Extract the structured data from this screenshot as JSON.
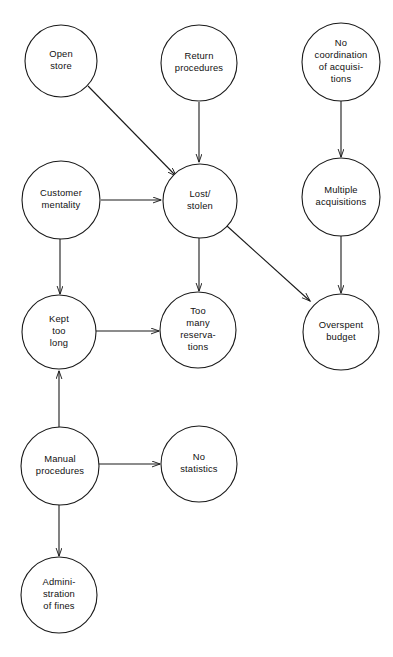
{
  "diagram": {
    "type": "causal-relationship-diagram",
    "title": "",
    "canvas": {
      "width": 393,
      "height": 657,
      "background": "#ffffff"
    },
    "style": {
      "stroke": "#1a1a1a",
      "node_fill": "#ffffff",
      "text_color": "#111111"
    },
    "nodes": [
      {
        "id": "open-store",
        "label": "Open store",
        "lines": [
          "Open",
          "store"
        ],
        "cx": 61,
        "cy": 61,
        "r": 36
      },
      {
        "id": "return-procedures",
        "label": "Return procedures",
        "lines": [
          "Return",
          "procedures"
        ],
        "cx": 199,
        "cy": 63,
        "r": 38
      },
      {
        "id": "no-coordination-of-acquisitions",
        "label": "No coordination of acquisitions",
        "lines": [
          "No",
          "coordination",
          "of acquisi-",
          "tions"
        ],
        "cx": 341,
        "cy": 62,
        "r": 39
      },
      {
        "id": "customer-mentality",
        "label": "Customer mentality",
        "lines": [
          "Customer",
          "mentality"
        ],
        "cx": 61,
        "cy": 200,
        "r": 39
      },
      {
        "id": "lost-stolen",
        "label": "Lost/ stolen",
        "lines": [
          "Lost/",
          "stolen"
        ],
        "cx": 200,
        "cy": 201,
        "r": 37
      },
      {
        "id": "multiple-acquisitions",
        "label": "Multiple acquisitions",
        "lines": [
          "Multiple",
          "acquisitions"
        ],
        "cx": 341,
        "cy": 197,
        "r": 39
      },
      {
        "id": "kept-too-long",
        "label": "Kept too long",
        "lines": [
          "Kept",
          "too",
          "long"
        ],
        "cx": 59,
        "cy": 332,
        "r": 37
      },
      {
        "id": "too-many-reservations",
        "label": "Too many reservations",
        "lines": [
          "Too",
          "many",
          "reserva-",
          "tions"
        ],
        "cx": 198,
        "cy": 330,
        "r": 38
      },
      {
        "id": "overspent-budget",
        "label": "Overspent budget",
        "lines": [
          "Overspent",
          "budget"
        ],
        "cx": 341,
        "cy": 332,
        "r": 38
      },
      {
        "id": "manual-procedures",
        "label": "Manual procedures",
        "lines": [
          "Manual",
          "procedures"
        ],
        "cx": 60,
        "cy": 466,
        "r": 39
      },
      {
        "id": "no-statistics",
        "label": "No statistics",
        "lines": [
          "No",
          "statistics"
        ],
        "cx": 199,
        "cy": 464,
        "r": 38
      },
      {
        "id": "administration-of-fines",
        "label": "Administration of fines",
        "lines": [
          "Admini-",
          "stration",
          "of fines"
        ],
        "cx": 59,
        "cy": 595,
        "r": 38
      }
    ],
    "edges": [
      {
        "id": "edge-open-store-to-lost-stolen",
        "from": "open-store",
        "to": "lost-stolen",
        "x1": 88,
        "y1": 86,
        "x2": 176,
        "y2": 176
      },
      {
        "id": "edge-return-procedures-to-lost-stolen",
        "from": "return-procedures",
        "to": "lost-stolen",
        "x1": 199,
        "y1": 102,
        "x2": 199,
        "y2": 162
      },
      {
        "id": "edge-customer-mentality-to-lost-stolen",
        "from": "customer-mentality",
        "to": "lost-stolen",
        "x1": 101,
        "y1": 200,
        "x2": 161,
        "y2": 200
      },
      {
        "id": "edge-no-coordination-to-multiple-acquisitions",
        "from": "no-coordination-of-acquisitions",
        "to": "multiple-acquisitions",
        "x1": 341,
        "y1": 101,
        "x2": 341,
        "y2": 157
      },
      {
        "id": "edge-customer-mentality-to-kept-too-long",
        "from": "customer-mentality",
        "to": "kept-too-long",
        "x1": 60,
        "y1": 239,
        "x2": 60,
        "y2": 294
      },
      {
        "id": "edge-lost-stolen-to-too-many-reservations",
        "from": "lost-stolen",
        "to": "too-many-reservations",
        "x1": 199,
        "y1": 238,
        "x2": 199,
        "y2": 291
      },
      {
        "id": "edge-lost-stolen-to-overspent-budget",
        "from": "lost-stolen",
        "to": "overspent-budget",
        "x1": 227,
        "y1": 226,
        "x2": 310,
        "y2": 301
      },
      {
        "id": "edge-multiple-acquisitions-to-overspent-budget",
        "from": "multiple-acquisitions",
        "to": "overspent-budget",
        "x1": 341,
        "y1": 236,
        "x2": 341,
        "y2": 293
      },
      {
        "id": "edge-kept-too-long-to-too-many-reservations",
        "from": "kept-too-long",
        "to": "too-many-reservations",
        "x1": 96,
        "y1": 331,
        "x2": 159,
        "y2": 331
      },
      {
        "id": "edge-manual-procedures-to-kept-too-long",
        "from": "manual-procedures",
        "to": "kept-too-long",
        "x1": 59,
        "y1": 427,
        "x2": 59,
        "y2": 371
      },
      {
        "id": "edge-manual-procedures-to-no-statistics",
        "from": "manual-procedures",
        "to": "no-statistics",
        "x1": 99,
        "y1": 464,
        "x2": 160,
        "y2": 464
      },
      {
        "id": "edge-manual-procedures-to-administration-of-fines",
        "from": "manual-procedures",
        "to": "administration-of-fines",
        "x1": 59,
        "y1": 505,
        "x2": 59,
        "y2": 556
      }
    ]
  }
}
